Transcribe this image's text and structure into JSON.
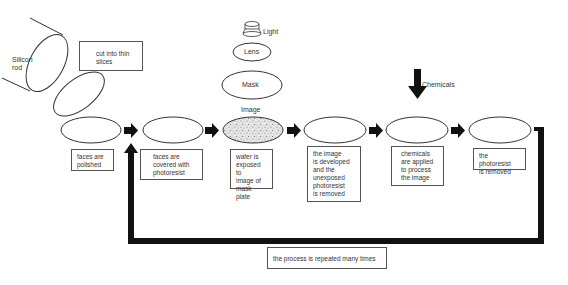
{
  "diagram": {
    "top_labels": {
      "silicon_rod": "Silicon rod",
      "cut_into_slices": "cut into thin slices",
      "light": "Light",
      "lens": "Lens",
      "mask": "Mask",
      "image": "Image",
      "chemicals": "Chemicals"
    },
    "steps": [
      {
        "id": 1,
        "label": "faces are polished",
        "lines": [
          "faces are",
          "polished"
        ]
      },
      {
        "id": 2,
        "label": "faces are covered with photoresist",
        "lines": [
          "faces are",
          "covered with",
          "photoresist"
        ]
      },
      {
        "id": 3,
        "label": "wafer is exposed to image of mask plate",
        "lines": [
          "wafer is",
          "exposed to",
          "image of",
          "mask plate"
        ]
      },
      {
        "id": 4,
        "label": "the image is developed and the unexposed photoresist is removed",
        "lines": [
          "the image",
          "is developed",
          "and the",
          "unexposed",
          "photoresist",
          "is removed"
        ]
      },
      {
        "id": 5,
        "label": "chemicals are applied to process the image",
        "lines": [
          "chemicals",
          "are applied",
          "to process",
          "the image"
        ]
      },
      {
        "id": 6,
        "label": "the photoresist is removed",
        "lines": [
          "the photoresist",
          "is removed"
        ]
      }
    ],
    "loop_label": "the process is repeated many times",
    "colors": {
      "line": "#333333",
      "arrow": "#111111",
      "box_border": "#555555",
      "text": "#333333"
    }
  }
}
